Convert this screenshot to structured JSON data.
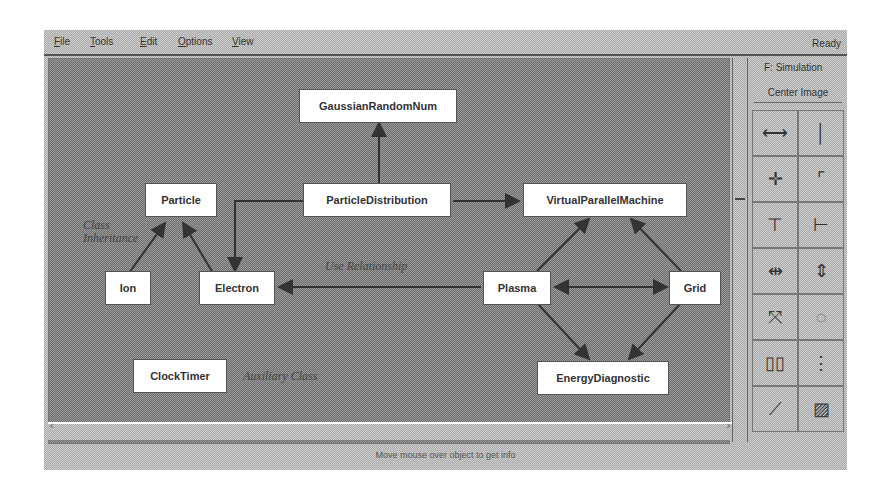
{
  "menubar": {
    "items": [
      "File",
      "Tools",
      "Edit",
      "Options",
      "View"
    ],
    "status": "Ready"
  },
  "sidepanel": {
    "simulation_label": "F: Simulation",
    "center_image_button": "Center Image",
    "tools": [
      {
        "name": "horizontal-line-tool",
        "glyph": "⟷"
      },
      {
        "name": "vertical-line-tool",
        "glyph": "│"
      },
      {
        "name": "crosshair-tool",
        "glyph": "✛"
      },
      {
        "name": "corner-box-tool",
        "glyph": "⌜"
      },
      {
        "name": "align-top-tool",
        "glyph": "⊤"
      },
      {
        "name": "align-left-tool",
        "glyph": "⊢"
      },
      {
        "name": "distribute-horizontal-tool",
        "glyph": "⇹"
      },
      {
        "name": "distribute-vertical-tool",
        "glyph": "⇕"
      },
      {
        "name": "scatter-tool",
        "glyph": "⤧"
      },
      {
        "name": "circle-layout-tool",
        "glyph": "◌"
      },
      {
        "name": "side-by-side-tool",
        "glyph": "▯▯"
      },
      {
        "name": "stack-tool",
        "glyph": "⋮"
      },
      {
        "name": "link-tool",
        "glyph": "⟋"
      },
      {
        "name": "fill-tool",
        "glyph": "▨"
      }
    ]
  },
  "diagram": {
    "nodes": [
      {
        "id": "GaussianRandomNum",
        "label": "GaussianRandomNum"
      },
      {
        "id": "Particle",
        "label": "Particle"
      },
      {
        "id": "ParticleDistribution",
        "label": "ParticleDistribution"
      },
      {
        "id": "VirtualParallelMachine",
        "label": "VirtualParallelMachine"
      },
      {
        "id": "Ion",
        "label": "Ion"
      },
      {
        "id": "Electron",
        "label": "Electron"
      },
      {
        "id": "Plasma",
        "label": "Plasma"
      },
      {
        "id": "Grid",
        "label": "Grid"
      },
      {
        "id": "ClockTimer",
        "label": "ClockTimer"
      },
      {
        "id": "EnergyDiagnostic",
        "label": "EnergyDiagnostic"
      }
    ],
    "notes": {
      "class_inheritance": "Class Inheritance",
      "use_relationship": "Use Relationship",
      "auxiliary_class": "Auxiliary Class"
    }
  },
  "statusbar": {
    "message": "Move mouse over object to get info"
  }
}
